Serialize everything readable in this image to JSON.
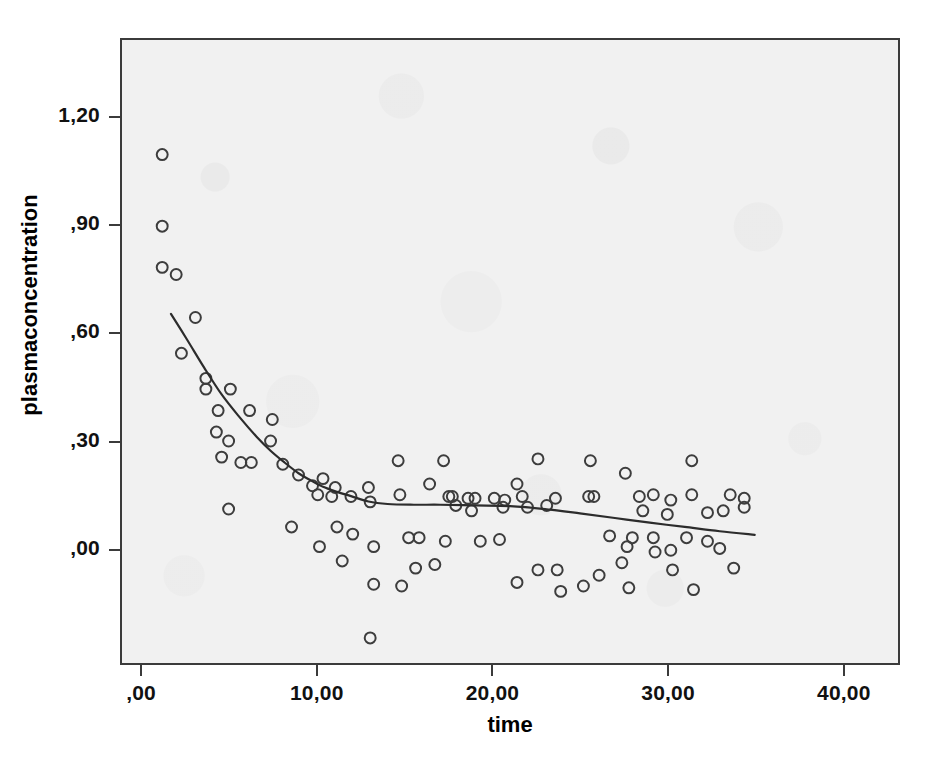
{
  "chart_data": {
    "type": "scatter",
    "title": "",
    "xlabel": "time",
    "ylabel": "plasmaconcentration",
    "xlim": [
      -1.2,
      43.2
    ],
    "ylim": [
      -0.32,
      1.42
    ],
    "grid": false,
    "legend": null,
    "xticks": [
      {
        "value": 0,
        "label": ",00"
      },
      {
        "value": 10,
        "label": "10,00"
      },
      {
        "value": 20,
        "label": "20,00"
      },
      {
        "value": 30,
        "label": "30,00"
      },
      {
        "value": 40,
        "label": "40,00"
      }
    ],
    "yticks": [
      {
        "value": 1.2,
        "label": "1,20"
      },
      {
        "value": 0.9,
        "label": ",90"
      },
      {
        "value": 0.6,
        "label": ",60"
      },
      {
        "value": 0.3,
        "label": ",30"
      },
      {
        "value": 0.0,
        "label": ",00"
      }
    ],
    "marker": {
      "shape": "open-circle",
      "radius": 5.5,
      "stroke": "#3d3d3d",
      "stroke_width": 2,
      "fill": "none"
    },
    "points": [
      [
        1.1,
        1.1
      ],
      [
        1.1,
        0.9
      ],
      [
        1.1,
        0.785
      ],
      [
        1.9,
        0.765
      ],
      [
        3.0,
        0.645
      ],
      [
        2.2,
        0.545
      ],
      [
        3.6,
        0.475
      ],
      [
        3.6,
        0.445
      ],
      [
        5.0,
        0.445
      ],
      [
        4.3,
        0.385
      ],
      [
        6.1,
        0.385
      ],
      [
        4.2,
        0.325
      ],
      [
        7.4,
        0.36
      ],
      [
        4.9,
        0.3
      ],
      [
        7.3,
        0.3
      ],
      [
        4.5,
        0.255
      ],
      [
        5.6,
        0.24
      ],
      [
        6.2,
        0.24
      ],
      [
        8.0,
        0.235
      ],
      [
        8.9,
        0.205
      ],
      [
        10.3,
        0.195
      ],
      [
        14.6,
        0.245
      ],
      [
        17.2,
        0.245
      ],
      [
        22.6,
        0.25
      ],
      [
        25.6,
        0.245
      ],
      [
        31.4,
        0.245
      ],
      [
        9.7,
        0.175
      ],
      [
        11.0,
        0.17
      ],
      [
        12.9,
        0.17
      ],
      [
        16.4,
        0.18
      ],
      [
        21.4,
        0.18
      ],
      [
        27.6,
        0.21
      ],
      [
        4.9,
        0.11
      ],
      [
        10.0,
        0.15
      ],
      [
        10.8,
        0.145
      ],
      [
        11.9,
        0.145
      ],
      [
        13.0,
        0.13
      ],
      [
        14.7,
        0.15
      ],
      [
        17.5,
        0.145
      ],
      [
        17.7,
        0.145
      ],
      [
        18.6,
        0.14
      ],
      [
        19.0,
        0.14
      ],
      [
        20.1,
        0.14
      ],
      [
        20.7,
        0.135
      ],
      [
        21.7,
        0.145
      ],
      [
        23.6,
        0.14
      ],
      [
        25.5,
        0.145
      ],
      [
        25.8,
        0.145
      ],
      [
        28.4,
        0.145
      ],
      [
        29.2,
        0.15
      ],
      [
        30.2,
        0.135
      ],
      [
        31.4,
        0.15
      ],
      [
        33.6,
        0.15
      ],
      [
        34.4,
        0.14
      ],
      [
        34.4,
        0.115
      ],
      [
        17.9,
        0.12
      ],
      [
        18.8,
        0.105
      ],
      [
        20.6,
        0.115
      ],
      [
        22.0,
        0.115
      ],
      [
        23.1,
        0.12
      ],
      [
        28.6,
        0.105
      ],
      [
        30.0,
        0.095
      ],
      [
        32.3,
        0.1
      ],
      [
        33.2,
        0.105
      ],
      [
        8.5,
        0.06
      ],
      [
        11.1,
        0.06
      ],
      [
        12.0,
        0.04
      ],
      [
        15.2,
        0.03
      ],
      [
        15.8,
        0.03
      ],
      [
        17.3,
        0.02
      ],
      [
        20.4,
        0.025
      ],
      [
        26.7,
        0.035
      ],
      [
        28.0,
        0.03
      ],
      [
        29.2,
        0.03
      ],
      [
        31.1,
        0.03
      ],
      [
        32.3,
        0.02
      ],
      [
        10.1,
        0.005
      ],
      [
        13.2,
        0.005
      ],
      [
        19.3,
        0.02
      ],
      [
        27.7,
        0.005
      ],
      [
        29.3,
        -0.01
      ],
      [
        30.2,
        -0.005
      ],
      [
        33.0,
        0.0
      ],
      [
        11.4,
        -0.035
      ],
      [
        15.6,
        -0.055
      ],
      [
        16.7,
        -0.045
      ],
      [
        22.6,
        -0.06
      ],
      [
        23.7,
        -0.06
      ],
      [
        26.1,
        -0.075
      ],
      [
        27.4,
        -0.04
      ],
      [
        30.3,
        -0.06
      ],
      [
        33.8,
        -0.055
      ],
      [
        13.2,
        -0.1
      ],
      [
        14.8,
        -0.105
      ],
      [
        21.4,
        -0.095
      ],
      [
        23.9,
        -0.12
      ],
      [
        25.2,
        -0.105
      ],
      [
        27.8,
        -0.11
      ],
      [
        31.5,
        -0.115
      ],
      [
        13.0,
        -0.25
      ]
    ],
    "fit_line": {
      "name": "loess-smoother",
      "stroke": "#2c2c2c",
      "stroke_width": 2.2,
      "x": [
        1.6,
        2.5,
        3.5,
        4.5,
        5.5,
        6.5,
        7.3,
        8.1,
        8.9,
        9.6,
        10.3,
        11.1,
        11.9,
        12.9,
        14.0,
        15.5,
        17.0,
        19.0,
        21.0,
        23.0,
        25.0,
        27.0,
        29.0,
        31.0,
        33.0,
        35.0
      ],
      "y": [
        0.655,
        0.585,
        0.505,
        0.43,
        0.368,
        0.312,
        0.273,
        0.24,
        0.21,
        0.19,
        0.172,
        0.158,
        0.146,
        0.131,
        0.124,
        0.122,
        0.122,
        0.12,
        0.118,
        0.11,
        0.098,
        0.085,
        0.072,
        0.06,
        0.048,
        0.038
      ]
    }
  }
}
